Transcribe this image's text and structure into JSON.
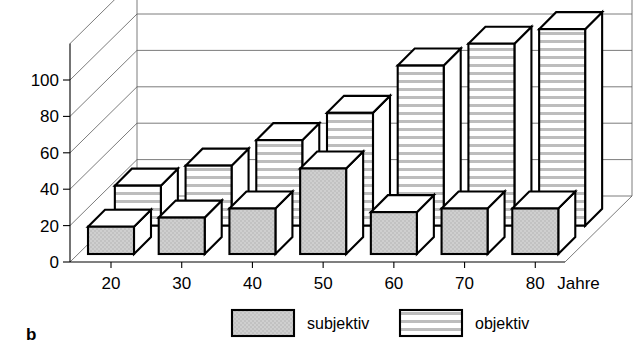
{
  "panel": {
    "letter": "b"
  },
  "chart_data": {
    "type": "bar",
    "title": "",
    "subtitle": "",
    "xlabel": "Jahre",
    "ylabel": "",
    "categories": [
      "20",
      "30",
      "40",
      "50",
      "60",
      "70",
      "80"
    ],
    "x_axis_unit_label": "Jahre",
    "xtick_labels": [
      "20",
      "30",
      "40",
      "50",
      "60",
      "70",
      "80"
    ],
    "ytick_labels": [
      "0",
      "20",
      "40",
      "60",
      "80",
      "100"
    ],
    "yticks": [
      0,
      20,
      40,
      60,
      80,
      100
    ],
    "ylim": [
      0,
      120
    ],
    "grid": true,
    "grid_axis": "y",
    "legend_position": "bottom",
    "three_d": true,
    "series": [
      {
        "name": "subjektiv",
        "fill": "solid-gray",
        "color": "#c9c9c9",
        "values": [
          15,
          20,
          25,
          47,
          23,
          25,
          25
        ]
      },
      {
        "name": "objektiv",
        "fill": "horizontal-stripes",
        "color": "#ffffff",
        "values": [
          22,
          33,
          47,
          62,
          88,
          100,
          108
        ]
      }
    ]
  },
  "legend": {
    "items": [
      {
        "label": "subjektiv",
        "swatch": "solid-gray-swatch"
      },
      {
        "label": "objektiv",
        "swatch": "striped-swatch"
      }
    ]
  },
  "colors": {
    "bar_fill_subjektiv": "#c9c9c9",
    "bar_fill_objektiv": "#ffffff",
    "bar_stripe": "#b5b5b5",
    "bar_top": "#ffffff",
    "bar_side": "#ffffff",
    "outline": "#000000",
    "gridline": "#5a5a5a",
    "background": "#ffffff"
  }
}
